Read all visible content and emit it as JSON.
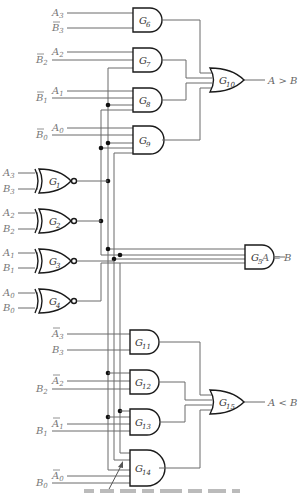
{
  "diagram": {
    "gates": {
      "G1": {
        "label": "G",
        "sub": "1",
        "type": "XNOR"
      },
      "G2": {
        "label": "G",
        "sub": "2",
        "type": "XNOR"
      },
      "G3": {
        "label": "G",
        "sub": "3",
        "type": "XNOR"
      },
      "G4": {
        "label": "G",
        "sub": "4",
        "type": "XNOR"
      },
      "G5": {
        "label": "G",
        "sub": "5",
        "type": "AND"
      },
      "G6": {
        "label": "G",
        "sub": "6",
        "type": "AND"
      },
      "G7": {
        "label": "G",
        "sub": "7",
        "type": "AND"
      },
      "G8": {
        "label": "G",
        "sub": "8",
        "type": "AND"
      },
      "G9": {
        "label": "G",
        "sub": "9",
        "type": "AND"
      },
      "G10": {
        "label": "G",
        "sub": "10",
        "type": "OR"
      },
      "G11": {
        "label": "G",
        "sub": "11",
        "type": "AND"
      },
      "G12": {
        "label": "G",
        "sub": "12",
        "type": "AND"
      },
      "G13": {
        "label": "G",
        "sub": "13",
        "type": "AND"
      },
      "G14": {
        "label": "G",
        "sub": "14",
        "type": "AND"
      },
      "G15": {
        "label": "G",
        "sub": "15",
        "type": "OR"
      }
    },
    "inputs": {
      "g6": [
        {
          "v": "A",
          "s": "3",
          "bar": false
        },
        {
          "v": "B",
          "s": "3",
          "bar": true
        }
      ],
      "g7": [
        {
          "v": "A",
          "s": "2",
          "bar": false
        },
        {
          "v": "B",
          "s": "2",
          "bar": true
        }
      ],
      "g8": [
        {
          "v": "A",
          "s": "1",
          "bar": false
        },
        {
          "v": "B",
          "s": "1",
          "bar": true
        }
      ],
      "g9": [
        {
          "v": "A",
          "s": "0",
          "bar": false
        },
        {
          "v": "B",
          "s": "0",
          "bar": true
        }
      ],
      "g1": [
        {
          "v": "A",
          "s": "3"
        },
        {
          "v": "B",
          "s": "3"
        }
      ],
      "g2": [
        {
          "v": "A",
          "s": "2"
        },
        {
          "v": "B",
          "s": "2"
        }
      ],
      "g3": [
        {
          "v": "A",
          "s": "1"
        },
        {
          "v": "B",
          "s": "1"
        }
      ],
      "g4": [
        {
          "v": "A",
          "s": "0"
        },
        {
          "v": "B",
          "s": "0"
        }
      ],
      "g11": [
        {
          "v": "A",
          "s": "3",
          "bar": true
        },
        {
          "v": "B",
          "s": "3",
          "bar": false
        }
      ],
      "g12": [
        {
          "v": "A",
          "s": "2",
          "bar": true
        },
        {
          "v": "B",
          "s": "2",
          "bar": false
        }
      ],
      "g13": [
        {
          "v": "A",
          "s": "1",
          "bar": true
        },
        {
          "v": "B",
          "s": "1",
          "bar": false
        }
      ],
      "g14": [
        {
          "v": "A",
          "s": "0",
          "bar": true
        },
        {
          "v": "B",
          "s": "0",
          "bar": false
        }
      ]
    },
    "outputs": {
      "gt": "A > B",
      "eq": "A = B",
      "lt": "A < B"
    }
  }
}
